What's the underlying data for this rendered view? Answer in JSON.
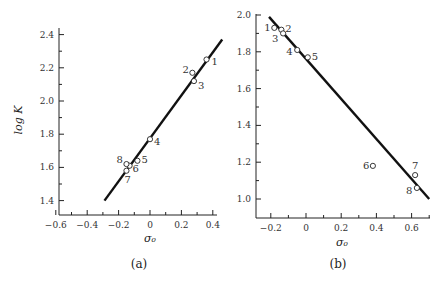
{
  "chart_data": [
    {
      "type": "scatter",
      "panel_label": "(a)",
      "title": "",
      "xlabel": "σ₀",
      "ylabel": "log K",
      "xlim": [
        -0.6,
        0.45
      ],
      "ylim": [
        1.32,
        2.45
      ],
      "xticks": [
        -0.6,
        -0.5,
        -0.4,
        -0.3,
        -0.2,
        -0.1,
        0,
        0.1,
        0.2,
        0.3,
        0.4
      ],
      "xtick_labels": [
        "−0.6",
        "",
        "−0.4",
        "",
        "−0.2",
        "",
        "0",
        "",
        "0.2",
        "",
        "0.4"
      ],
      "yticks": [
        1.4,
        1.5,
        1.6,
        1.7,
        1.8,
        1.9,
        2.0,
        2.1,
        2.2,
        2.3,
        2.4
      ],
      "ytick_labels": [
        "1.4",
        "",
        "1.6",
        "",
        "1.8",
        "",
        "2.0",
        "",
        "2.2",
        "",
        "2.4"
      ],
      "grid": false,
      "points": [
        {
          "label": "1",
          "x": 0.36,
          "y": 2.25
        },
        {
          "label": "2",
          "x": 0.27,
          "y": 2.17
        },
        {
          "label": "3",
          "x": 0.28,
          "y": 2.12
        },
        {
          "label": "4",
          "x": 0.0,
          "y": 1.77
        },
        {
          "label": "5",
          "x": -0.08,
          "y": 1.64
        },
        {
          "label": "6",
          "x": -0.13,
          "y": 1.61
        },
        {
          "label": "7",
          "x": -0.15,
          "y": 1.58
        },
        {
          "label": "8",
          "x": -0.15,
          "y": 1.62
        }
      ],
      "fit_line": {
        "x": [
          -0.29,
          0.46
        ],
        "y": [
          1.4,
          2.37
        ]
      }
    },
    {
      "type": "scatter",
      "panel_label": "(b)",
      "title": "",
      "xlabel": "σ₀",
      "ylabel": "",
      "xlim": [
        -0.29,
        0.72
      ],
      "ylim": [
        0.9,
        2.0
      ],
      "xticks": [
        -0.2,
        -0.1,
        0,
        0.1,
        0.2,
        0.3,
        0.4,
        0.5,
        0.6,
        0.7
      ],
      "xtick_labels": [
        "−0.2",
        "",
        "0",
        "",
        "0.2",
        "",
        "0.4",
        "",
        "0.6",
        ""
      ],
      "yticks": [
        1.0,
        1.1,
        1.2,
        1.3,
        1.4,
        1.5,
        1.6,
        1.7,
        1.8,
        1.9,
        2.0
      ],
      "ytick_labels": [
        "1.0",
        "",
        "1.2",
        "",
        "1.4",
        "",
        "1.6",
        "",
        "1.8",
        "",
        "2.0"
      ],
      "grid": false,
      "points": [
        {
          "label": "1",
          "x": -0.18,
          "y": 1.93
        },
        {
          "label": "2",
          "x": -0.14,
          "y": 1.92
        },
        {
          "label": "3",
          "x": -0.13,
          "y": 1.9
        },
        {
          "label": "4",
          "x": -0.05,
          "y": 1.81
        },
        {
          "label": "5",
          "x": 0.01,
          "y": 1.77
        },
        {
          "label": "6",
          "x": 0.38,
          "y": 1.18
        },
        {
          "label": "7",
          "x": 0.62,
          "y": 1.13
        },
        {
          "label": "8",
          "x": 0.63,
          "y": 1.06
        }
      ],
      "fit_line": {
        "x": [
          -0.21,
          0.7
        ],
        "y": [
          1.99,
          1.0
        ]
      }
    }
  ]
}
